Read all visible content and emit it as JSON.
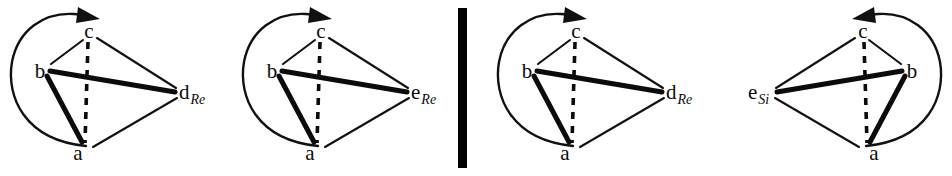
{
  "figure": {
    "background_color": "#ffffff",
    "line_color": "#111111",
    "width": 952,
    "height": 176
  },
  "divider": {
    "name": "vertical-separator",
    "color": "#000000",
    "x": 458,
    "y": 8,
    "width": 9,
    "height": 160
  },
  "structures": [
    {
      "id": "structure-1",
      "descriptor": "Re",
      "rotation": "clockwise",
      "origin_x": 0,
      "vertices": [
        {
          "key": "a",
          "label": "a",
          "subscript": "",
          "x": 84,
          "y": 152
        },
        {
          "key": "b",
          "label": "b",
          "subscript": "",
          "x": 40,
          "y": 72
        },
        {
          "key": "c",
          "label": "c",
          "subscript": "",
          "x": 90,
          "y": 32
        },
        {
          "key": "d",
          "label": "d",
          "subscript": "Re",
          "x": 186,
          "y": 92
        }
      ],
      "bonds": [
        {
          "from": "b",
          "to": "c",
          "style": "thin"
        },
        {
          "from": "c",
          "to": "d",
          "style": "thin"
        },
        {
          "from": "a",
          "to": "d",
          "style": "thin"
        },
        {
          "from": "b",
          "to": "d",
          "style": "bold"
        },
        {
          "from": "b",
          "to": "a",
          "style": "bold"
        },
        {
          "from": "c",
          "to": "a",
          "style": "dashed"
        }
      ]
    },
    {
      "id": "structure-2",
      "descriptor": "Re",
      "rotation": "clockwise",
      "origin_x": 232,
      "vertices": [
        {
          "key": "a",
          "label": "a",
          "subscript": "",
          "x": 84,
          "y": 152
        },
        {
          "key": "b",
          "label": "b",
          "subscript": "",
          "x": 40,
          "y": 72
        },
        {
          "key": "c",
          "label": "c",
          "subscript": "",
          "x": 90,
          "y": 32
        },
        {
          "key": "e",
          "label": "e",
          "subscript": "Re",
          "x": 186,
          "y": 92
        }
      ],
      "bonds": [
        {
          "from": "b",
          "to": "c",
          "style": "thin"
        },
        {
          "from": "c",
          "to": "e",
          "style": "thin"
        },
        {
          "from": "a",
          "to": "e",
          "style": "thin"
        },
        {
          "from": "b",
          "to": "e",
          "style": "bold"
        },
        {
          "from": "b",
          "to": "a",
          "style": "bold"
        },
        {
          "from": "c",
          "to": "a",
          "style": "dashed"
        }
      ]
    },
    {
      "id": "structure-3",
      "descriptor": "Re",
      "rotation": "clockwise",
      "origin_x": 487,
      "vertices": [
        {
          "key": "a",
          "label": "a",
          "subscript": "",
          "x": 84,
          "y": 152
        },
        {
          "key": "b",
          "label": "b",
          "subscript": "",
          "x": 40,
          "y": 72
        },
        {
          "key": "c",
          "label": "c",
          "subscript": "",
          "x": 90,
          "y": 32
        },
        {
          "key": "d",
          "label": "d",
          "subscript": "Re",
          "x": 186,
          "y": 92
        }
      ],
      "bonds": [
        {
          "from": "b",
          "to": "c",
          "style": "thin"
        },
        {
          "from": "c",
          "to": "d",
          "style": "thin"
        },
        {
          "from": "a",
          "to": "d",
          "style": "thin"
        },
        {
          "from": "b",
          "to": "d",
          "style": "bold"
        },
        {
          "from": "b",
          "to": "a",
          "style": "bold"
        },
        {
          "from": "c",
          "to": "a",
          "style": "dashed"
        }
      ]
    },
    {
      "id": "structure-4",
      "descriptor": "Si",
      "rotation": "counterclockwise",
      "origin_x": 742,
      "vertices": [
        {
          "key": "a",
          "label": "a",
          "subscript": "",
          "x": 126,
          "y": 152
        },
        {
          "key": "b",
          "label": "b",
          "subscript": "",
          "x": 170,
          "y": 72
        },
        {
          "key": "c",
          "label": "c",
          "subscript": "",
          "x": 120,
          "y": 32
        },
        {
          "key": "e",
          "label": "e",
          "subscript": "Si",
          "x": 24,
          "y": 92
        }
      ],
      "bonds": [
        {
          "from": "b",
          "to": "c",
          "style": "thin"
        },
        {
          "from": "c",
          "to": "e",
          "style": "thin"
        },
        {
          "from": "a",
          "to": "e",
          "style": "thin"
        },
        {
          "from": "b",
          "to": "e",
          "style": "bold"
        },
        {
          "from": "b",
          "to": "a",
          "style": "bold"
        },
        {
          "from": "c",
          "to": "a",
          "style": "dashed"
        }
      ]
    }
  ],
  "labels": {
    "s1_a": "a",
    "s1_b": "b",
    "s1_c": "c",
    "s1_d": "d",
    "s1_d_sub": "Re",
    "s2_a": "a",
    "s2_b": "b",
    "s2_c": "c",
    "s2_e": "e",
    "s2_e_sub": "Re",
    "s3_a": "a",
    "s3_b": "b",
    "s3_c": "c",
    "s3_d": "d",
    "s3_d_sub": "Re",
    "s4_a": "a",
    "s4_b": "b",
    "s4_c": "c",
    "s4_e": "e",
    "s4_e_sub": "Si"
  }
}
